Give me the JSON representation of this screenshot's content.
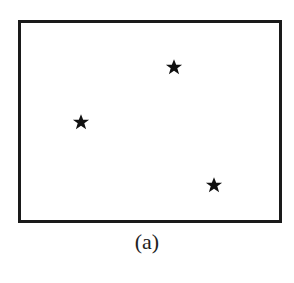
{
  "figure": {
    "caption": "(a)",
    "frame": {
      "left": 18,
      "top": 20,
      "right": 282,
      "bottom": 223
    },
    "stars": [
      {
        "x": 174,
        "y": 67
      },
      {
        "x": 81,
        "y": 122
      },
      {
        "x": 214,
        "y": 185
      }
    ],
    "star_color": "#111111",
    "border_color": "#1a1a1a"
  }
}
